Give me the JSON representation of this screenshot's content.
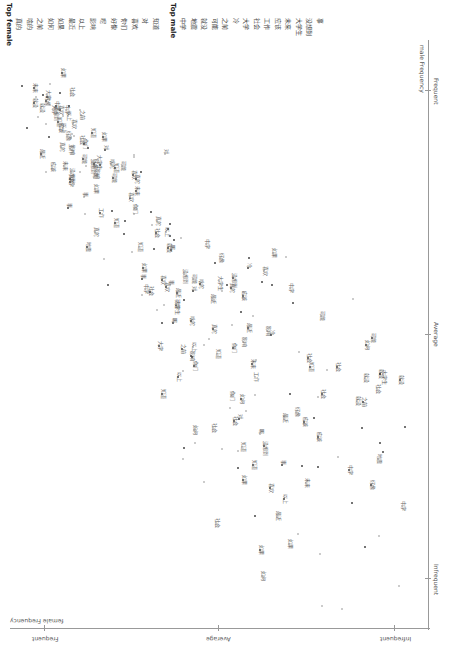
{
  "chart_data": {
    "type": "scatter",
    "orientation": "rotated 90deg clockwise",
    "title": "",
    "xlabel": "female Frequency",
    "ylabel": "male Frequency",
    "x_ticks": [
      "Frequent",
      "Average",
      "Infrequent"
    ],
    "y_ticks": [
      "Frequent",
      "Average",
      "Infrequent"
    ],
    "grid": false,
    "legend": null,
    "top_lists": {
      "female": {
        "title": "Top female",
        "terms": [
          "真的",
          "啥的",
          "之前",
          "如何",
          "如果",
          "最近",
          "以上",
          "影响",
          "呢",
          "好像",
          "你们",
          "喜欢",
          "对",
          "知道"
        ]
      },
      "male": {
        "title": "Top male",
        "terms": [
          "中学",
          "地震",
          "就没",
          "可能",
          "之前",
          "冷",
          "大学",
          "社会",
          "工作",
          "应该",
          "未来",
          "大学生",
          "没想到",
          "事"
        ]
      }
    },
    "points_note": "Several hundred term points (small dots with CJK labels) spread diagonally from frequent-female/frequent-male to infrequent region; individual label text largely illegible at this resolution."
  },
  "lists": {
    "female_title": "Top female",
    "male_title": "Top male",
    "female": [
      "真的",
      "啥的",
      "之前",
      "如何",
      "如果",
      "最近",
      "以上",
      "影响",
      "呢",
      "好像",
      "你们",
      "喜欢",
      "对",
      "知道"
    ],
    "male": [
      "中学",
      "地震",
      "就没",
      "可能",
      "之前",
      "冷",
      "大学",
      "社会",
      "工作",
      "应该",
      "未来",
      "大学生",
      "没想到",
      "事"
    ]
  },
  "axes": {
    "y_axis_label": "male Frequency",
    "x_axis_label": "female Frequency",
    "y_ticks": [
      "Frequent",
      "Average",
      "Infrequent"
    ],
    "x_ticks": [
      "Frequent",
      "Average",
      "Infrequent"
    ]
  }
}
